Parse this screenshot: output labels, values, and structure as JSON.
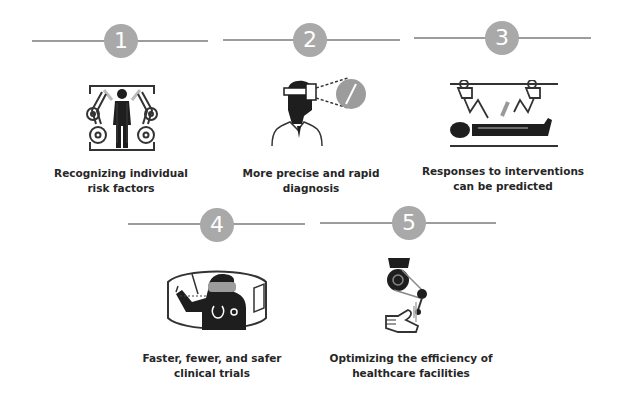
{
  "colors": {
    "line": "#9c9c9c",
    "circle": "#a9a9a9",
    "number_text": "#ffffff",
    "caption_text": "#262626",
    "icon_dark": "#1e1e1e"
  },
  "steps": [
    {
      "number": "1",
      "caption_line1": "Recognizing individual",
      "caption_line2": "risk factors",
      "icon": "robot-arms-scanning-person-icon"
    },
    {
      "number": "2",
      "caption_line1": "More precise and rapid",
      "caption_line2": "diagnosis",
      "icon": "doctor-vr-headset-icon"
    },
    {
      "number": "3",
      "caption_line1": "Responses to interventions",
      "caption_line2": "can be predicted",
      "icon": "surgical-robot-patient-icon"
    },
    {
      "number": "4",
      "caption_line1": "Faster, fewer, and safer",
      "caption_line2": "clinical trials",
      "icon": "doctor-virtual-environment-icon"
    },
    {
      "number": "5",
      "caption_line1": "Optimizing the efficiency of",
      "caption_line2": "healthcare facilities",
      "icon": "robotic-hand-icon"
    }
  ]
}
